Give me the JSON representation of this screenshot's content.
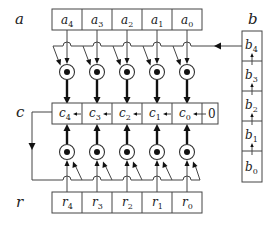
{
  "labels": {
    "a": "a",
    "b": "b",
    "c": "c",
    "r": "r"
  },
  "registers": {
    "a": {
      "cells": [
        {
          "base": "a",
          "sub": "4"
        },
        {
          "base": "a",
          "sub": "3"
        },
        {
          "base": "a",
          "sub": "2"
        },
        {
          "base": "a",
          "sub": "1"
        },
        {
          "base": "a",
          "sub": "0"
        }
      ]
    },
    "c": {
      "cells": [
        {
          "base": "c",
          "sub": "4"
        },
        {
          "base": "c",
          "sub": "3"
        },
        {
          "base": "c",
          "sub": "2"
        },
        {
          "base": "c",
          "sub": "1"
        },
        {
          "base": "c",
          "sub": "0"
        }
      ],
      "shift_in": "0"
    },
    "r": {
      "cells": [
        {
          "base": "r",
          "sub": "4"
        },
        {
          "base": "r",
          "sub": "3"
        },
        {
          "base": "r",
          "sub": "2"
        },
        {
          "base": "r",
          "sub": "1"
        },
        {
          "base": "r",
          "sub": "0"
        }
      ]
    },
    "b": {
      "cells": [
        {
          "base": "b",
          "sub": "4"
        },
        {
          "base": "b",
          "sub": "3"
        },
        {
          "base": "b",
          "sub": "2"
        },
        {
          "base": "b",
          "sub": "1"
        },
        {
          "base": "b",
          "sub": "0"
        }
      ]
    }
  },
  "operators": {
    "upper_row_count": 5,
    "lower_row_count": 5,
    "symbol": "circled-dot"
  },
  "colors": {
    "line": "#444444",
    "thick": "#111111",
    "background": "#ffffff"
  }
}
